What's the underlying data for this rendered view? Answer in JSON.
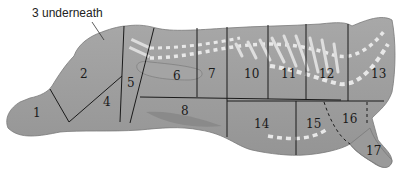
{
  "diagram": {
    "callout": "3 underneath",
    "colors": {
      "body": "#9e9e9e",
      "body_light": "#b4b4b4",
      "line": "#1a1a1a",
      "fat": "#e6e6e6"
    },
    "cuts": [
      {
        "id": "1",
        "label": "1"
      },
      {
        "id": "2",
        "label": "2"
      },
      {
        "id": "4",
        "label": "4"
      },
      {
        "id": "5",
        "label": "5"
      },
      {
        "id": "6",
        "label": "6"
      },
      {
        "id": "7",
        "label": "7"
      },
      {
        "id": "8",
        "label": "8"
      },
      {
        "id": "10",
        "label": "10"
      },
      {
        "id": "11",
        "label": "11"
      },
      {
        "id": "12",
        "label": "12"
      },
      {
        "id": "13",
        "label": "13"
      },
      {
        "id": "14",
        "label": "14"
      },
      {
        "id": "15",
        "label": "15"
      },
      {
        "id": "16",
        "label": "16"
      },
      {
        "id": "17",
        "label": "17"
      }
    ]
  }
}
